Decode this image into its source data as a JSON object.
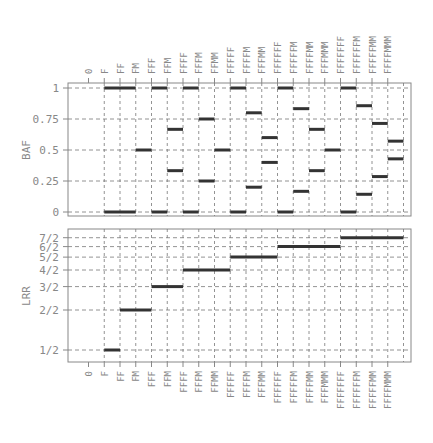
{
  "chart_data": [
    {
      "type": "segment",
      "title": "",
      "ylabel": "BAF",
      "xlabel": "",
      "ylim": [
        0,
        1
      ],
      "yticks": [
        "0",
        "0.25",
        "0.5",
        "0.75",
        "1"
      ],
      "grid": true,
      "categories": [
        "0",
        "F",
        "FF",
        "FM",
        "FFF",
        "FFM",
        "FFFF",
        "FFFM",
        "FFMM",
        "FFFFF",
        "FFFFM",
        "FFFMM",
        "FFFFFF",
        "FFFFFM",
        "FFFFMM",
        "FFFMMM",
        "FFFFFFF",
        "FFFFFFM",
        "FFFFFMM",
        "FFFFMMM"
      ],
      "values": [
        [],
        [
          0,
          1
        ],
        [
          0,
          1
        ],
        [
          0.5
        ],
        [
          0,
          1
        ],
        [
          0.3333,
          0.6667
        ],
        [
          0,
          1
        ],
        [
          0.25,
          0.75
        ],
        [
          0.5
        ],
        [
          0,
          1
        ],
        [
          0.2,
          0.8
        ],
        [
          0.4,
          0.6
        ],
        [
          0,
          1
        ],
        [
          0.1667,
          0.8333
        ],
        [
          0.3333,
          0.6667
        ],
        [
          0.5
        ],
        [
          0,
          1
        ],
        [
          0.1429,
          0.8571
        ],
        [
          0.2857,
          0.7143
        ],
        [
          0.4286,
          0.5714
        ]
      ]
    },
    {
      "type": "segment",
      "title": "",
      "ylabel": "LRR",
      "xlabel": "",
      "yscale": "log2",
      "yticks": [
        "1/2",
        "2/2",
        "3/2",
        "4/2",
        "5/2",
        "6/2",
        "7/2"
      ],
      "ytick_values": [
        0.5,
        1,
        1.5,
        2,
        2.5,
        3,
        3.5
      ],
      "grid": true,
      "categories": [
        "0",
        "F",
        "FF",
        "FM",
        "FFF",
        "FFM",
        "FFFF",
        "FFFM",
        "FFMM",
        "FFFFF",
        "FFFFM",
        "FFFMM",
        "FFFFFF",
        "FFFFFM",
        "FFFFMM",
        "FFFMMM",
        "FFFFFFF",
        "FFFFFFM",
        "FFFFFMM",
        "FFFFMMM"
      ],
      "values": [
        null,
        0.5,
        1,
        1,
        1.5,
        1.5,
        2,
        2,
        2,
        2.5,
        2.5,
        2.5,
        3,
        3,
        3,
        3,
        3.5,
        3.5,
        3.5,
        3.5
      ]
    }
  ]
}
